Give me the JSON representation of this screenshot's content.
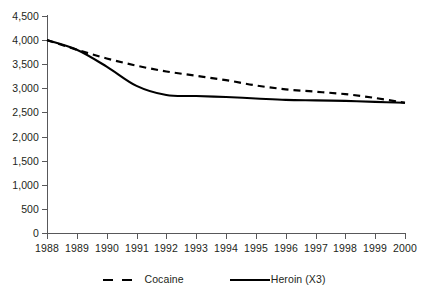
{
  "chart_data": {
    "type": "line",
    "title": "",
    "subtitle": "",
    "xlabel": "",
    "ylabel": "",
    "categories": [
      "1988",
      "1989",
      "1990",
      "1991",
      "1992",
      "1993",
      "1994",
      "1995",
      "1996",
      "1997",
      "1998",
      "1999",
      "2000"
    ],
    "series": [
      {
        "name": "Cocaine",
        "style": "dashed",
        "color": "#000000",
        "values": [
          4000,
          3800,
          3620,
          3470,
          3350,
          3260,
          3170,
          3060,
          2980,
          2930,
          2880,
          2800,
          2700
        ]
      },
      {
        "name": "Heroin (X3)",
        "style": "solid",
        "color": "#000000",
        "values": [
          4000,
          3800,
          3450,
          3050,
          2860,
          2840,
          2820,
          2790,
          2760,
          2750,
          2740,
          2720,
          2700
        ]
      }
    ],
    "ylim": [
      0,
      4500
    ],
    "ytick_step": 500,
    "ytick_labels": [
      "0",
      "500",
      "1,000",
      "1,500",
      "2,000",
      "2,500",
      "3,000",
      "3,500",
      "4,000",
      "4,500"
    ],
    "ytick_values": [
      0,
      500,
      1000,
      1500,
      2000,
      2500,
      3000,
      3500,
      4000,
      4500
    ],
    "grid": false,
    "legend_position": "bottom",
    "legend_entries": [
      "Cocaine",
      "Heroin (X3)"
    ],
    "axis_color": "#58585a",
    "background_color": "#ffffff"
  },
  "legend": {
    "cocaine_label": "Cocaine",
    "heroin_label": "Heroin (X3)"
  }
}
